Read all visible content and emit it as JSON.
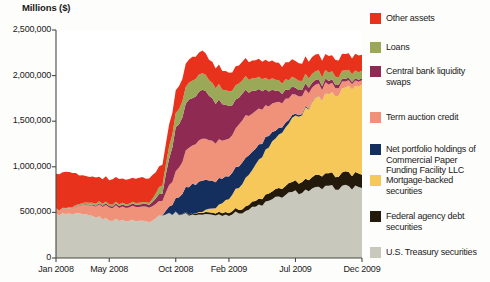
{
  "figure": {
    "axis_title": "Millions ($)",
    "background_color": "#fdfdfb"
  },
  "legend": {
    "items": [
      {
        "label": "Other assets",
        "color": "#e8321c",
        "name": "legend-item-other-assets"
      },
      {
        "label": "Loans",
        "color": "#9aa858",
        "name": "legend-item-loans"
      },
      {
        "label": "Central bank liquidity swaps",
        "color": "#8f2b52",
        "name": "legend-item-central-bank-liquidity-swaps"
      },
      {
        "label": "Term auction credit",
        "color": "#f0927a",
        "name": "legend-item-term-auction-credit"
      },
      {
        "label": "Net portfolio holdings of Commercial Paper Funding Facility LLC",
        "color": "#142f5e",
        "name": "legend-item-cpff"
      },
      {
        "label": "Mortgage-backed securities",
        "color": "#f6c85a",
        "name": "legend-item-mortgage-backed-securities"
      },
      {
        "label": "Federal agency debt securities",
        "color": "#241a0c",
        "name": "legend-item-federal-agency-debt-securities"
      },
      {
        "label": "U.S. Treasury securities",
        "color": "#c9c8bd",
        "name": "legend-item-us-treasury-securities"
      }
    ]
  },
  "chart_data": {
    "type": "area",
    "title": "",
    "subtitle": "",
    "xlabel": "",
    "ylabel": "Millions ($)",
    "ylim": [
      0,
      2500000
    ],
    "ytick_values": [
      0,
      500000,
      1000000,
      1500000,
      2000000,
      2500000
    ],
    "ytick_labels": [
      "0",
      "500,000",
      "1,000,000",
      "1,500,000",
      "2,000,000",
      "2,500,000"
    ],
    "xtick_labels": [
      "Jan 2008",
      "May 2008",
      "Oct 2008",
      "Feb 2009",
      "Jul 2009",
      "Dec 2009"
    ],
    "xtick_positions": [
      0,
      4,
      9,
      13,
      18,
      23
    ],
    "grid": false,
    "legend_position": "right",
    "stacked": true,
    "x": [
      "Jan 2008",
      "Feb 2008",
      "Mar 2008",
      "Apr 2008",
      "May 2008",
      "Jun 2008",
      "Jul 2008",
      "Aug 2008",
      "Sep 2008",
      "Oct 2008",
      "Nov 2008",
      "Dec 2008",
      "Jan 2009",
      "Feb 2009",
      "Mar 2009",
      "Apr 2009",
      "May 2009",
      "Jun 2009",
      "Jul 2009",
      "Aug 2009",
      "Sep 2009",
      "Oct 2009",
      "Nov 2009",
      "Dec 2009"
    ],
    "series": [
      {
        "name": "U.S. Treasury securities",
        "color": "#c9c8bd",
        "values": [
          480000,
          478000,
          470000,
          450000,
          420000,
          412000,
          408000,
          405000,
          480000,
          490000,
          476000,
          475000,
          475000,
          478000,
          505000,
          560000,
          620000,
          680000,
          720000,
          745000,
          765000,
          775000,
          778000,
          780000
        ]
      },
      {
        "name": "Federal agency debt securities",
        "color": "#241a0c",
        "values": [
          0,
          0,
          0,
          0,
          0,
          0,
          0,
          0,
          0,
          3000,
          12000,
          20000,
          25000,
          32000,
          45000,
          62000,
          80000,
          98000,
          112000,
          125000,
          135000,
          142000,
          148000,
          150000
        ]
      },
      {
        "name": "Mortgage-backed securities",
        "color": "#f6c85a",
        "values": [
          0,
          0,
          0,
          0,
          0,
          0,
          0,
          0,
          0,
          0,
          0,
          10000,
          60000,
          150000,
          270000,
          390000,
          510000,
          630000,
          720000,
          790000,
          850000,
          900000,
          940000,
          970000
        ]
      },
      {
        "name": "Net portfolio holdings of Commercial Paper Funding Facility LLC",
        "color": "#142f5e",
        "values": [
          0,
          0,
          0,
          0,
          0,
          0,
          0,
          0,
          0,
          145000,
          310000,
          330000,
          290000,
          250000,
          235000,
          180000,
          120000,
          60000,
          20000,
          8000,
          2000,
          0,
          0,
          0
        ]
      },
      {
        "name": "Term auction credit",
        "color": "#f0927a",
        "values": [
          48000,
          60000,
          95000,
          125000,
          145000,
          150000,
          155000,
          160000,
          155000,
          300000,
          420000,
          450000,
          415000,
          400000,
          470000,
          400000,
          330000,
          270000,
          215000,
          165000,
          120000,
          90000,
          60000,
          50000
        ]
      },
      {
        "name": "Central bank liquidity swaps",
        "color": "#8f2b52",
        "values": [
          0,
          2000,
          5000,
          12000,
          18000,
          22000,
          25000,
          30000,
          90000,
          480000,
          530000,
          545000,
          450000,
          350000,
          290000,
          230000,
          160000,
          105000,
          75000,
          60000,
          45000,
          35000,
          28000,
          20000
        ]
      },
      {
        "name": "Loans",
        "color": "#9aa858",
        "values": [
          5000,
          8000,
          18000,
          22000,
          20000,
          18000,
          18000,
          20000,
          95000,
          160000,
          190000,
          180000,
          170000,
          160000,
          150000,
          135000,
          125000,
          115000,
          105000,
          100000,
          95000,
          90000,
          85000,
          80000
        ]
      },
      {
        "name": "Other assets",
        "color": "#e8321c",
        "values": [
          390000,
          385000,
          300000,
          280000,
          270000,
          275000,
          270000,
          265000,
          220000,
          250000,
          255000,
          250000,
          215000,
          200000,
          205000,
          200000,
          195000,
          190000,
          190000,
          185000,
          185000,
          180000,
          180000,
          180000
        ]
      }
    ],
    "annotations": {
      "peak_total": 2310000,
      "peak_date": "Oct 2008",
      "start_total": 923000,
      "end_total": 2230000
    }
  }
}
